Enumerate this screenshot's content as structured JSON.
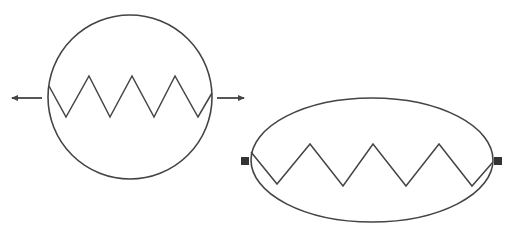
{
  "diagram": {
    "type": "heat-exchanger-symbols",
    "colors": {
      "stroke": "#444444",
      "background": "#ffffff",
      "port": "#333333"
    },
    "symbols": [
      {
        "name": "circular-heat-exchanger",
        "shape": "circle",
        "center": [
          130,
          97
        ],
        "radius": 82,
        "coil": "zigzag",
        "coil_peaks": 4,
        "flow_arrows": [
          "left-outflow",
          "right-outflow"
        ]
      },
      {
        "name": "elliptical-heat-exchanger",
        "shape": "ellipse",
        "center": [
          372,
          160
        ],
        "rx": 121,
        "ry": 62,
        "coil": "zigzag",
        "coil_peaks": 3,
        "ports": [
          "left-square-port",
          "right-square-port"
        ]
      }
    ]
  }
}
